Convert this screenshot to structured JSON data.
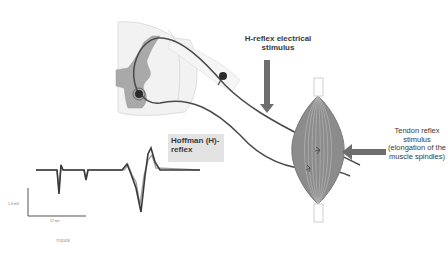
{
  "diagram": {
    "labels": {
      "h_reflex_stimulus": "H-reflex electrical stimulus",
      "tendon_reflex_stimulus": "Tendon reflex stimulus (elongation of the muscle spindles)",
      "hoffman_reflex": "Hoffman (H)-reflex"
    },
    "trace": {
      "scale_bar_vertical": "1.0 mV",
      "scale_bar_horizontal": "17 ms",
      "recording_id": "7132458"
    },
    "components": [
      "spinal-cord",
      "sensory-neuron",
      "motor-neuron",
      "dorsal-root-ganglion",
      "muscle",
      "tendon",
      "stimulus-arrow-electrical",
      "stimulus-arrow-tendon",
      "emg-trace"
    ],
    "colors": {
      "nerve": "#4a4a4a",
      "gray_matter": "#a9a9a9",
      "white_matter": "#f0f0f0",
      "muscle": "#8c8c8c",
      "arrow": "#6e6e6e",
      "label_box": "#e3e3e3"
    }
  }
}
